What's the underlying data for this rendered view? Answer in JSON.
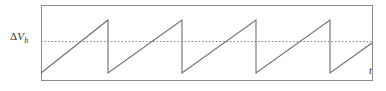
{
  "figure": {
    "title": "",
    "y_axis_label_delta": "Δ",
    "y_axis_label_var": "V",
    "y_axis_label_sub": "h",
    "x_axis_label": "t",
    "frame": {
      "x": 41,
      "y": 5,
      "width": 331,
      "height": 75
    },
    "colors": {
      "frame": "#8a8a8a",
      "waveform": "#6e6e6e",
      "reference_line": "#8a8a8a",
      "text": "#2b2b2b",
      "background": "#ffffff"
    }
  },
  "chart_data": {
    "type": "line",
    "title": "",
    "xlabel": "t",
    "ylabel": "ΔV_h",
    "grid": false,
    "legend": null,
    "xlim": [
      41,
      372
    ],
    "ylim": [
      80,
      5
    ],
    "annotations": [
      {
        "text": "ΔV_h",
        "type": "y-axis-label",
        "x": 10,
        "y": 41
      },
      {
        "text": "t",
        "type": "x-axis-label",
        "x": 369,
        "y": 71
      }
    ],
    "reference_lines": [
      {
        "name": "delta-vh-threshold",
        "orientation": "horizontal",
        "y": 41,
        "style": "dotted",
        "label": "ΔV_h",
        "x_start": 41,
        "x_end": 372
      }
    ],
    "series": [
      {
        "name": "sawtooth-waveform",
        "style": "solid",
        "cycles": 4,
        "period_px": 74,
        "peak_y": 20,
        "trough_y": 73,
        "points": [
          [
            41,
            73
          ],
          [
            108,
            20
          ],
          [
            108,
            73
          ],
          [
            182,
            20
          ],
          [
            182,
            73
          ],
          [
            256,
            20
          ],
          [
            256,
            73
          ],
          [
            330,
            20
          ],
          [
            330,
            73
          ],
          [
            372,
            43
          ]
        ]
      }
    ]
  }
}
